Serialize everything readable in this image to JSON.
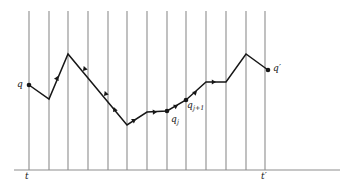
{
  "figure": {
    "kind": "piecewise-linear-path-diagram",
    "background_color": "#ffffff",
    "axis_color": "#8d8d8d",
    "gridline_color": "#8d8d8d",
    "path_color": "#171717",
    "label_color": "#171717",
    "labels": {
      "q": "q",
      "q_prime_base": "q",
      "q_prime_mark": "′",
      "q_j_base": "q",
      "q_j_sub": "j",
      "q_j1_base": "q",
      "q_j1_sub": "j+1",
      "t": "t",
      "t_prime_base": "t",
      "t_prime_mark": "′"
    },
    "axis": {
      "y": 170,
      "x_start": 14,
      "x_end": 340
    },
    "gridlines": {
      "top_y": 11,
      "bottom_y": 170,
      "x_positions": [
        29,
        49,
        68,
        88,
        108,
        127,
        147,
        167,
        186,
        206,
        226,
        246,
        265
      ]
    },
    "path_points": [
      {
        "x": 29,
        "y": 85,
        "name": "q"
      },
      {
        "x": 49,
        "y": 99,
        "name": ""
      },
      {
        "x": 68,
        "y": 54,
        "name": ""
      },
      {
        "x": 127,
        "y": 125,
        "name": ""
      },
      {
        "x": 147,
        "y": 112,
        "name": ""
      },
      {
        "x": 167,
        "y": 111,
        "name": "q_j"
      },
      {
        "x": 186,
        "y": 100,
        "name": "q_j+1"
      },
      {
        "x": 206,
        "y": 82,
        "name": ""
      },
      {
        "x": 226,
        "y": 82,
        "name": ""
      },
      {
        "x": 246,
        "y": 54,
        "name": ""
      },
      {
        "x": 268,
        "y": 70,
        "name": "q_prime"
      }
    ],
    "vertex_dots": [
      {
        "x": 29,
        "y": 85
      },
      {
        "x": 167,
        "y": 111
      },
      {
        "x": 186,
        "y": 100
      },
      {
        "x": 268,
        "y": 70
      }
    ],
    "direction_arrows": [
      {
        "x": 58,
        "y": 76,
        "angle": -67
      },
      {
        "x": 83,
        "y": 71,
        "angle": 130
      },
      {
        "x": 104,
        "y": 96,
        "angle": 130
      },
      {
        "x": 113,
        "y": 112,
        "angle": 130
      },
      {
        "x": 136,
        "y": 119,
        "angle": -33
      },
      {
        "x": 157,
        "y": 112,
        "angle": -3
      },
      {
        "x": 178,
        "y": 105,
        "angle": -30
      },
      {
        "x": 197,
        "y": 91,
        "angle": -42
      },
      {
        "x": 216,
        "y": 82,
        "angle": 0
      }
    ]
  }
}
